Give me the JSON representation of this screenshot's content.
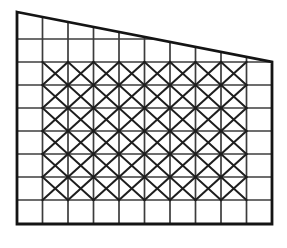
{
  "figure": {
    "kind": "line-drawing",
    "background_color": "#ffffff"
  },
  "geometry": {
    "left_x": 17,
    "right_x": 272,
    "bottom_y": 224,
    "top_left_y": 12,
    "top_right_y": 62,
    "columns": 10,
    "horizontal_levels": [
      39,
      62,
      85,
      108,
      131,
      154,
      177,
      200,
      224
    ],
    "brace_col_start": 1,
    "brace_col_end": 9,
    "brace_row_start": 1,
    "brace_row_end": 7
  },
  "style": {
    "outline_color": "#141414",
    "grid_color": "#3c3c3c",
    "brace_color": "#1e1e1e",
    "outline_width": 2.8,
    "grid_width": 1.7,
    "brace_width": 2.0
  },
  "labels": {
    "outline_name": "frame-outline",
    "grid_name": "grid-lines",
    "brace_name": "diagonal-braces"
  }
}
